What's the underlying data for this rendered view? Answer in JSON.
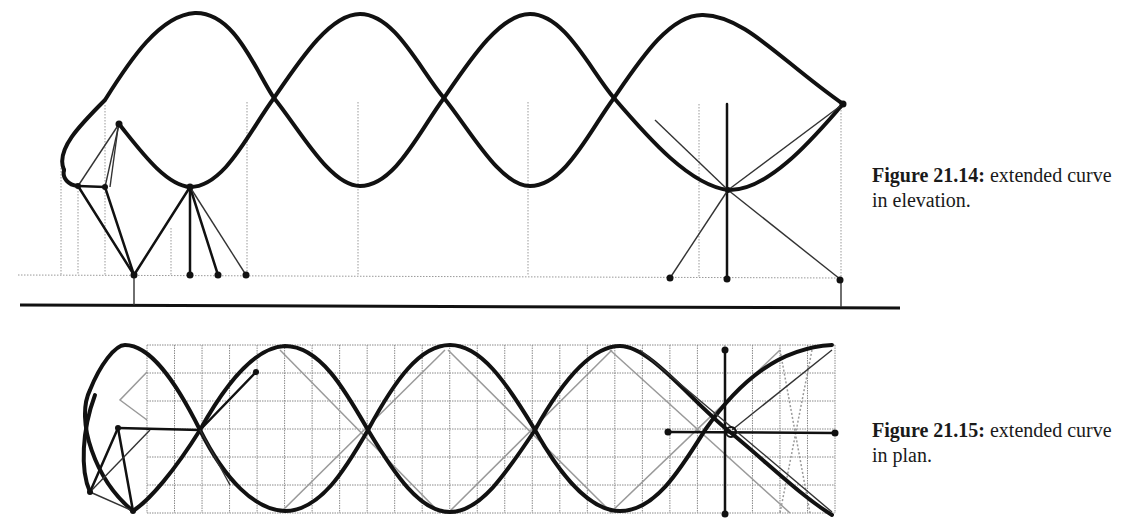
{
  "figures": [
    {
      "id": "21.14",
      "caption_number": "Figure 21.14:",
      "caption_text": " extended curve in elevation.",
      "view": "elevation"
    },
    {
      "id": "21.15",
      "caption_number": "Figure 21.15:",
      "caption_text": " extended curve in plan.",
      "view": "plan"
    }
  ],
  "elevation": {
    "upper_peaks_x": [
      190,
      360,
      530,
      700
    ],
    "crossings_x": [
      272,
      444,
      614,
      728
    ],
    "lower_troughs_x": [
      190,
      360,
      530,
      728
    ],
    "ground_line_y": 307,
    "baseline_y": 276
  },
  "plan": {
    "grid": {
      "x0": 147,
      "x1": 835,
      "y0": 345,
      "y1": 513,
      "cols": 25,
      "rows": 6
    }
  },
  "colors": {
    "ink": "#111111",
    "guide": "#999999",
    "background": "#ffffff"
  }
}
